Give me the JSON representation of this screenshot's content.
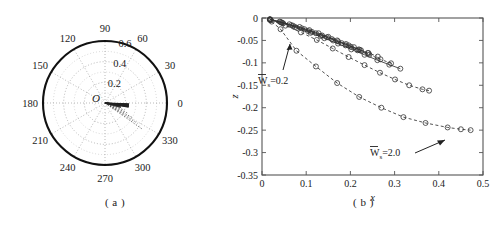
{
  "figure": {
    "panels": [
      {
        "id": "a",
        "caption": "( a )"
      },
      {
        "id": "b",
        "caption": "( b )"
      }
    ]
  },
  "chart_data": [
    {
      "type": "scatter",
      "subtype": "polar",
      "panel": "a",
      "title": "",
      "origin_label": "O",
      "grid": true,
      "angular_unit": "degrees",
      "angular_ticks": [
        0,
        30,
        60,
        90,
        120,
        150,
        180,
        210,
        240,
        270,
        300,
        330
      ],
      "angular_tick_labels": [
        "0",
        "30",
        "60",
        "90",
        "120",
        "150",
        "180",
        "210",
        "240",
        "270",
        "300",
        "330"
      ],
      "radial_ticks": [
        0.2,
        0.4,
        0.6
      ],
      "radial_tick_labels": [
        "0.2",
        "0.4",
        "0.6"
      ],
      "radial_label_angle": 75,
      "rlim": [
        0,
        0.6
      ],
      "series": [
        {
          "name": "ray-1",
          "style": "solid",
          "theta": [
            0,
            352
          ],
          "r": [
            0.0,
            0.14
          ]
        },
        {
          "name": "ray-2",
          "style": "solid",
          "theta": [
            0,
            349
          ],
          "r": [
            0.0,
            0.155
          ]
        },
        {
          "name": "ray-3",
          "style": "solid",
          "theta": [
            0,
            345
          ],
          "r": [
            0.0,
            0.16
          ]
        },
        {
          "name": "ray-4",
          "style": "dotted",
          "theta": [
            0,
            340
          ],
          "r": [
            0.0,
            0.2
          ]
        },
        {
          "name": "ray-5",
          "style": "dotted",
          "theta": [
            0,
            336
          ],
          "r": [
            0.0,
            0.235
          ]
        },
        {
          "name": "ray-6",
          "style": "dotted",
          "theta": [
            0,
            332
          ],
          "r": [
            0.0,
            0.3
          ]
        },
        {
          "name": "ray-7",
          "style": "dotted",
          "theta": [
            0,
            328
          ],
          "r": [
            0.0,
            0.37
          ]
        },
        {
          "name": "ray-8",
          "style": "dotted",
          "theta": [
            0,
            325
          ],
          "r": [
            0.0,
            0.44
          ]
        }
      ]
    },
    {
      "type": "line",
      "panel": "b",
      "title": "",
      "xlabel": "x",
      "ylabel": "z",
      "xlim": [
        0,
        0.5
      ],
      "ylim": [
        -0.35,
        0
      ],
      "xticks": [
        0,
        0.1,
        0.2,
        0.3,
        0.4,
        0.5
      ],
      "xtick_labels": [
        "0",
        "0.1",
        "0.2",
        "0.3",
        "0.4",
        "0.5"
      ],
      "yticks": [
        0,
        -0.05,
        -0.1,
        -0.15,
        -0.2,
        -0.25,
        -0.3,
        -0.35
      ],
      "ytick_labels": [
        "0",
        "-0.05",
        "-0.1",
        "-0.15",
        "-0.2",
        "-0.25",
        "-0.3",
        "-0.35"
      ],
      "grid": false,
      "marker": "circle",
      "annotations": [
        {
          "name": "ws-low-annotation",
          "text": "W",
          "sub": "s",
          "value": "=0.2",
          "overbar": true
        },
        {
          "name": "ws-high-annotation",
          "text": "W",
          "sub": "s",
          "value": "=2.0",
          "overbar": true
        }
      ],
      "series": [
        {
          "name": "Ws=0.2",
          "style": "solid",
          "x": [
            0.018,
            0.04,
            0.062,
            0.085,
            0.107,
            0.128,
            0.15,
            0.17,
            0.19,
            0.208,
            0.224
          ],
          "y": [
            -0.003,
            -0.008,
            -0.014,
            -0.02,
            -0.027,
            -0.034,
            -0.042,
            -0.05,
            -0.058,
            -0.065,
            -0.072
          ]
        },
        {
          "name": "Ws=0.4",
          "style": "solid",
          "x": [
            0.018,
            0.042,
            0.066,
            0.09,
            0.113,
            0.136,
            0.158,
            0.18,
            0.201,
            0.221,
            0.239
          ],
          "y": [
            -0.003,
            -0.009,
            -0.016,
            -0.023,
            -0.031,
            -0.039,
            -0.047,
            -0.056,
            -0.064,
            -0.071,
            -0.078
          ]
        },
        {
          "name": "Ws=0.6",
          "style": "dashdot",
          "x": [
            0.018,
            0.044,
            0.07,
            0.096,
            0.122,
            0.147,
            0.172,
            0.196,
            0.219,
            0.241,
            0.262
          ],
          "y": [
            -0.003,
            -0.01,
            -0.017,
            -0.025,
            -0.034,
            -0.043,
            -0.052,
            -0.061,
            -0.07,
            -0.078,
            -0.086
          ]
        },
        {
          "name": "Ws=0.8",
          "style": "dashed",
          "x": [
            0.018,
            0.046,
            0.075,
            0.104,
            0.133,
            0.161,
            0.189,
            0.216,
            0.243,
            0.268,
            0.292
          ],
          "y": [
            -0.004,
            -0.011,
            -0.02,
            -0.029,
            -0.04,
            -0.05,
            -0.061,
            -0.072,
            -0.082,
            -0.092,
            -0.101
          ]
        },
        {
          "name": "Ws=1.0",
          "style": "solid",
          "x": [
            0.018,
            0.048,
            0.079,
            0.11,
            0.141,
            0.172,
            0.202,
            0.232,
            0.261,
            0.288,
            0.313
          ],
          "y": [
            -0.004,
            -0.012,
            -0.022,
            -0.033,
            -0.045,
            -0.057,
            -0.07,
            -0.082,
            -0.094,
            -0.104,
            -0.113
          ]
        },
        {
          "name": "Ws=1.5",
          "style": "dashed",
          "x": [
            0.02,
            0.053,
            0.088,
            0.124,
            0.16,
            0.196,
            0.232,
            0.267,
            0.301,
            0.333,
            0.363,
            0.378
          ],
          "y": [
            -0.005,
            -0.017,
            -0.032,
            -0.049,
            -0.068,
            -0.087,
            -0.105,
            -0.122,
            -0.137,
            -0.15,
            -0.159,
            -0.162
          ]
        },
        {
          "name": "Ws=2.0",
          "style": "dashed",
          "x": [
            0.022,
            0.042,
            0.078,
            0.122,
            0.17,
            0.22,
            0.27,
            0.32,
            0.37,
            0.42,
            0.45,
            0.472
          ],
          "y": [
            -0.008,
            -0.025,
            -0.073,
            -0.108,
            -0.145,
            -0.176,
            -0.2,
            -0.221,
            -0.234,
            -0.244,
            -0.248,
            -0.25
          ]
        }
      ]
    }
  ]
}
